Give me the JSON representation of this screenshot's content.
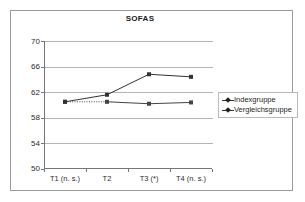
{
  "chart_data": {
    "type": "line",
    "title": "SOFAS",
    "xlabel": "",
    "ylabel": "",
    "categories": [
      "T1 (n. s.)",
      "T2",
      "T3 (*)",
      "T4 (n. s.)"
    ],
    "ylim": [
      50,
      70
    ],
    "yticks": [
      50,
      54,
      58,
      62,
      66,
      70
    ],
    "ytick_labels": [
      "50",
      "54",
      "58",
      "62",
      "66",
      "70"
    ],
    "grid": true,
    "legend_position": "right",
    "series": [
      {
        "name": "Indexgruppe",
        "values": [
          60.5,
          61.6,
          64.8,
          64.4
        ],
        "color": "#333333",
        "linestyle": "solid",
        "marker": "square"
      },
      {
        "name": "Vergleichsgruppe",
        "values": [
          60.5,
          60.5,
          60.2,
          60.4
        ],
        "color": "#444444",
        "linestyle": "dotted-then-solid",
        "marker": "square"
      }
    ]
  },
  "legend": {
    "entries": [
      {
        "label": "Indexgruppe"
      },
      {
        "label": "Vergleichsgruppe"
      }
    ]
  },
  "colors": {
    "frame": "#9a9a9a",
    "axis": "#767676",
    "grid": "#b4b4b4",
    "series_primary": "#333333",
    "series_secondary": "#444444",
    "text": "#1f1f1f",
    "background": "#ffffff"
  }
}
